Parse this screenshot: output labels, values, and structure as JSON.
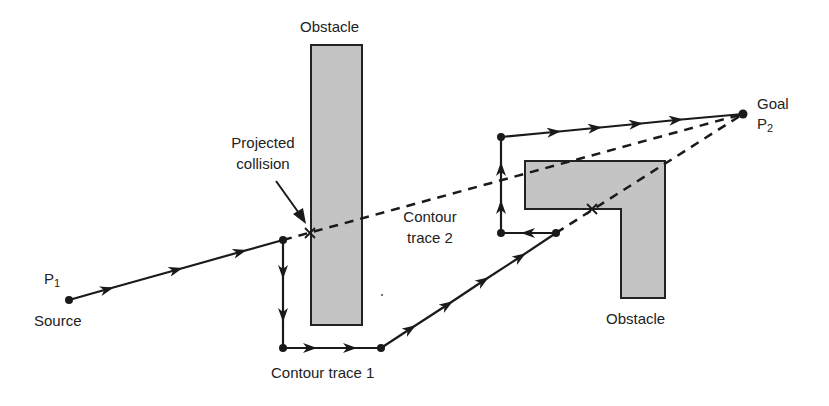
{
  "colors": {
    "ink": "#1a1a1a",
    "obstacle_fill": "#c4c4c4",
    "obstacle_stroke": "#222222",
    "text": "#222222",
    "background": "#ffffff"
  },
  "labels": {
    "obstacle_top": "Obstacle",
    "obstacle_bottom": "Obstacle",
    "projected_collision_line1": "Projected",
    "projected_collision_line2": "collision",
    "contour_trace_1": "Contour trace 1",
    "contour_trace_2_line1": "Contour",
    "contour_trace_2_line2": "trace 2",
    "source_point": "P",
    "source_point_sub": "1",
    "source": "Source",
    "goal": "Goal",
    "goal_point": "P",
    "goal_point_sub": "2"
  },
  "geometry": {
    "source": [
      69,
      300
    ],
    "goal": [
      743,
      114
    ],
    "path": [
      [
        69,
        300
      ],
      [
        283,
        240
      ],
      [
        283,
        348
      ],
      [
        381,
        348
      ],
      [
        556,
        233
      ],
      [
        501,
        233
      ],
      [
        501,
        137
      ],
      [
        743,
        114
      ]
    ],
    "projected_lines": [
      [
        [
          283,
          240
        ],
        [
          743,
          114
        ]
      ],
      [
        [
          556,
          233
        ],
        [
          743,
          114
        ]
      ]
    ],
    "collisions": [
      [
        310,
        233
      ],
      [
        592,
        209
      ]
    ],
    "obstacle_rect": {
      "x": 311,
      "y": 45,
      "w": 51,
      "h": 280
    },
    "obstacle_L": [
      [
        525,
        161
      ],
      [
        665,
        161
      ],
      [
        665,
        298
      ],
      [
        621,
        298
      ],
      [
        621,
        209
      ],
      [
        525,
        209
      ]
    ]
  }
}
